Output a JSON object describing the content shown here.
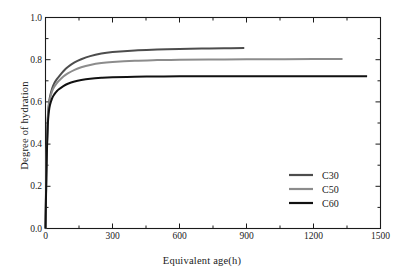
{
  "chart_data": {
    "type": "line",
    "title": "",
    "xlabel": "Equivalent age(h)",
    "ylabel": "Degree of hydration",
    "xlim": [
      0,
      1500
    ],
    "ylim": [
      0.0,
      1.0
    ],
    "xticks": [
      0,
      300,
      600,
      900,
      1200,
      1500
    ],
    "xtick_labels": [
      "0",
      "300",
      "600",
      "900",
      "1200",
      "1500"
    ],
    "yticks": [
      0.0,
      0.2,
      0.4,
      0.6,
      0.8,
      1.0
    ],
    "ytick_labels": [
      "0.0",
      "0.2",
      "0.4",
      "0.6",
      "0.8",
      "1.0"
    ],
    "minor_xticks": [
      150,
      450,
      750,
      1050,
      1350
    ],
    "minor_yticks": [
      0.1,
      0.3,
      0.5,
      0.7,
      0.9
    ],
    "grid": false,
    "legend_position": "lower right",
    "series": [
      {
        "name": "C30",
        "color": "#4d4d4d",
        "x_end": 890,
        "plateau": 0.855,
        "x": [
          0,
          2,
          5,
          10,
          15,
          20,
          30,
          40,
          50,
          60,
          80,
          100,
          130,
          160,
          200,
          250,
          300,
          400,
          500,
          600,
          700,
          800,
          890
        ],
        "y": [
          0.0,
          0.15,
          0.34,
          0.52,
          0.59,
          0.625,
          0.665,
          0.69,
          0.707,
          0.72,
          0.745,
          0.765,
          0.787,
          0.802,
          0.817,
          0.829,
          0.836,
          0.844,
          0.848,
          0.851,
          0.853,
          0.8545,
          0.855
        ]
      },
      {
        "name": "C50",
        "color": "#8c8c8c",
        "x_end": 1330,
        "plateau": 0.803,
        "x": [
          0,
          2,
          5,
          10,
          15,
          20,
          30,
          40,
          50,
          60,
          80,
          100,
          130,
          160,
          200,
          250,
          300,
          400,
          500,
          600,
          800,
          1000,
          1200,
          1330
        ],
        "y": [
          0.0,
          0.14,
          0.33,
          0.51,
          0.58,
          0.615,
          0.652,
          0.673,
          0.688,
          0.7,
          0.72,
          0.735,
          0.752,
          0.764,
          0.775,
          0.784,
          0.789,
          0.795,
          0.798,
          0.8,
          0.8015,
          0.802,
          0.8028,
          0.803
        ]
      },
      {
        "name": "C60",
        "color": "#111111",
        "x_end": 1440,
        "plateau": 0.722,
        "x": [
          0,
          2,
          5,
          10,
          15,
          20,
          30,
          40,
          50,
          60,
          80,
          100,
          130,
          160,
          200,
          250,
          300,
          400,
          500,
          600,
          800,
          1000,
          1200,
          1440
        ],
        "y": [
          0.0,
          0.13,
          0.31,
          0.485,
          0.553,
          0.585,
          0.618,
          0.637,
          0.65,
          0.66,
          0.675,
          0.686,
          0.697,
          0.704,
          0.71,
          0.714,
          0.7165,
          0.719,
          0.7205,
          0.7212,
          0.7218,
          0.722,
          0.7221,
          0.722
        ]
      }
    ],
    "legend": [
      {
        "label": "C30",
        "color": "#4d4d4d"
      },
      {
        "label": "C50",
        "color": "#8c8c8c"
      },
      {
        "label": "C60",
        "color": "#111111"
      }
    ]
  }
}
